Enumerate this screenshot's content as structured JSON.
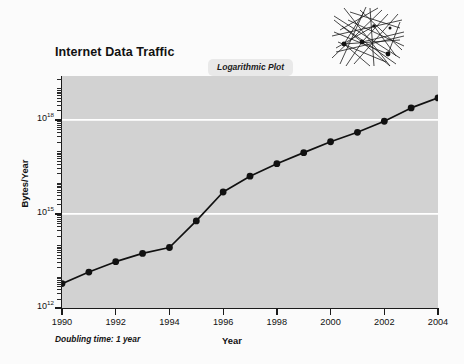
{
  "chart_data": {
    "type": "line",
    "title": "Internet Data Traffic",
    "badge": "Logarithmic Plot",
    "xlabel": "Year",
    "ylabel": "Bytes/Year",
    "annotation": "Doubling time: 1 year",
    "scale": "log",
    "grid": true,
    "legend": "none",
    "xlim": [
      1990,
      2004
    ],
    "ylim": [
      1000000000000.0,
      2.5e+19
    ],
    "x_tick_labels": [
      "1990",
      "1992",
      "1994",
      "1996",
      "1998",
      "2000",
      "2002",
      "2004"
    ],
    "x_ticks": [
      1990,
      1992,
      1994,
      1996,
      1998,
      2000,
      2002,
      2004
    ],
    "y_tick_labels": [
      "10",
      "10",
      "10"
    ],
    "y_tick_exponents": [
      "12",
      "15",
      "18"
    ],
    "y_ticks": [
      1000000000000.0,
      1000000000000000.0,
      1e+18
    ],
    "gridline_values": [
      1000000000000000.0,
      1e+18
    ],
    "x": [
      1990,
      1991,
      1992,
      1993,
      1994,
      1995,
      1996,
      1997,
      1998,
      1999,
      2000,
      2001,
      2002,
      2003,
      2004
    ],
    "values": [
      6000000000000.0,
      14000000000000.0,
      30000000000000.0,
      55000000000000.0,
      85000000000000.0,
      600000000000000.0,
      5000000000000000.0,
      1.6e+16,
      4e+16,
      9e+16,
      2e+17,
      4e+17,
      9e+17,
      2.4e+18,
      5e+18
    ],
    "marker": "filled-circle",
    "marker_color": "#111111",
    "line_color": "#111111",
    "plot_bg_color": "#d2d2d2",
    "grid_color": "#ffffff",
    "page_bg_color": "#fbfbfb"
  },
  "decoration": {
    "network_graphic_name": "network-mesh-graphic"
  }
}
